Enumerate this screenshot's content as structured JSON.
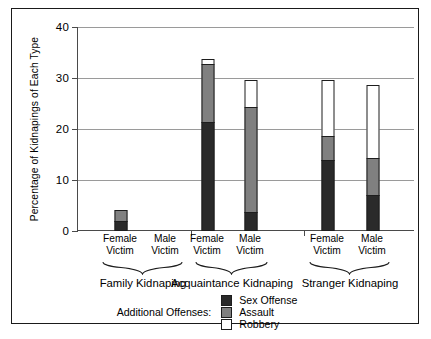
{
  "chart_data": {
    "type": "bar",
    "subtype": "stacked-grouped",
    "title": "",
    "xlabel": "",
    "ylabel": "Percentage of Kidnapings of Each Type",
    "ylim": [
      0,
      40
    ],
    "yticks": [
      0,
      10,
      20,
      30,
      40
    ],
    "ytick_labels": [
      "0",
      "10",
      "20",
      "30",
      "40"
    ],
    "grid": "horizontal",
    "legend_position": "bottom",
    "legend_title": "Additional Offenses:",
    "groups": [
      {
        "name": "Family Kidnaping",
        "categories": [
          "Female\nVictim",
          "Male\nVictim"
        ]
      },
      {
        "name": "Acquaintance Kidnaping",
        "categories": [
          "Female\nVictim",
          "Male\nVictim"
        ]
      },
      {
        "name": "Stranger Kidnaping",
        "categories": [
          "Female\nVictim",
          "Male\nVictim"
        ]
      }
    ],
    "categories": [
      "Family Kidnaping / Female Victim",
      "Family Kidnaping / Male Victim",
      "Acquaintance Kidnaping / Female Victim",
      "Acquaintance Kidnaping / Male Victim",
      "Stranger Kidnaping / Female Victim",
      "Stranger Kidnaping / Male Victim"
    ],
    "series": [
      {
        "name": "Sex Offense",
        "color": "#2a2a2a",
        "values": [
          2.0,
          0.0,
          21.4,
          3.7,
          13.9,
          7.1
        ]
      },
      {
        "name": "Assault",
        "color": "#808080",
        "values": [
          2.4,
          0.0,
          11.6,
          20.8,
          4.9,
          7.4
        ]
      },
      {
        "name": "Robbery",
        "color": "#ffffff",
        "values": [
          0.0,
          0.0,
          1.1,
          5.5,
          11.2,
          14.5
        ]
      }
    ],
    "totals": [
      4.4,
      0.0,
      34.1,
      30.0,
      30.0,
      29.0
    ]
  },
  "axis": {
    "y_title": "Percentage of Kidnapings of Each Type",
    "ticks": [
      {
        "value": 40,
        "label": "40"
      },
      {
        "value": 30,
        "label": "30"
      },
      {
        "value": 20,
        "label": "20"
      },
      {
        "value": 10,
        "label": "10"
      },
      {
        "value": 0,
        "label": "0"
      }
    ]
  },
  "x_ticks": [
    {
      "line1": "Female",
      "line2": "Victim"
    },
    {
      "line1": "Male",
      "line2": "Victim"
    },
    {
      "line1": "Female",
      "line2": "Victim"
    },
    {
      "line1": "Male",
      "line2": "Victim"
    },
    {
      "line1": "Female",
      "line2": "Victim"
    },
    {
      "line1": "Male",
      "line2": "Victim"
    }
  ],
  "group_labels": [
    "Family Kidnaping",
    "Acquaintance Kidnaping",
    "Stranger Kidnaping"
  ],
  "legend": {
    "title": "Additional Offenses:",
    "items": [
      {
        "label": "Sex Offense",
        "color": "#2a2a2a"
      },
      {
        "label": "Assault",
        "color": "#808080"
      },
      {
        "label": "Robbery",
        "color": "#ffffff"
      }
    ]
  }
}
